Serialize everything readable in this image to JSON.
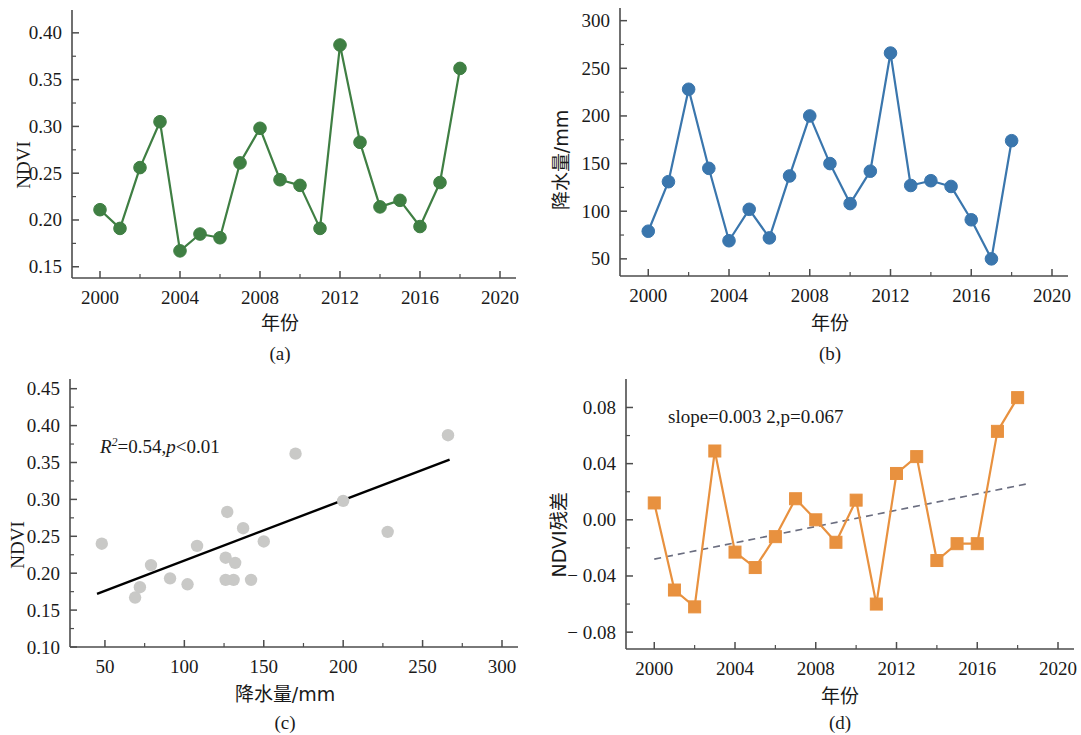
{
  "figure": {
    "panels": [
      "a",
      "b",
      "c",
      "d"
    ],
    "caption_a": "(a)",
    "caption_b": "(b)",
    "caption_c": "(c)",
    "caption_d": "(d)"
  },
  "labels": {
    "ndvi": "NDVI",
    "year": "年份",
    "precip_mm": "降水量/mm",
    "ndvi_residual": "NDVI残差"
  },
  "colors": {
    "green": "#3f7f43",
    "blue": "#3a76ad",
    "orange": "#e8913f",
    "scatter_gray": "#c9c9c7",
    "regression_black": "#000000",
    "trend_dashed": "#6b6e80",
    "axis": "#4d4d4d"
  },
  "chart_data": [
    {
      "id": "a",
      "type": "line",
      "title": "",
      "xlabel": "年份",
      "ylabel": "NDVI",
      "xlim": [
        1998.6,
        2020
      ],
      "ylim": [
        0.138,
        0.418
      ],
      "xticks": [
        2000,
        2004,
        2008,
        2012,
        2016,
        2020
      ],
      "xticklabels": [
        "2000",
        "2004",
        "2008",
        "2012",
        "2016",
        "2020"
      ],
      "yticks": [
        0.15,
        0.2,
        0.25,
        0.3,
        0.35,
        0.4
      ],
      "yticklabels": [
        "0.15",
        "0.20",
        "0.25",
        "0.30",
        "0.35",
        "0.40"
      ],
      "grid": false,
      "legend": "none",
      "marker": "circle",
      "color": "#3f7f43",
      "x": [
        2000,
        2001,
        2002,
        2003,
        2004,
        2005,
        2006,
        2007,
        2008,
        2009,
        2010,
        2011,
        2012,
        2013,
        2014,
        2015,
        2016,
        2017,
        2018
      ],
      "values": [
        0.211,
        0.191,
        0.256,
        0.305,
        0.167,
        0.185,
        0.181,
        0.261,
        0.298,
        0.243,
        0.237,
        0.191,
        0.387,
        0.283,
        0.214,
        0.221,
        0.193,
        0.24,
        0.362
      ]
    },
    {
      "id": "b",
      "type": "line",
      "title": "",
      "xlabel": "年份",
      "ylabel": "降水量/mm",
      "xlim": [
        1998.6,
        2020
      ],
      "ylim": [
        32,
        307
      ],
      "xticks": [
        2000,
        2004,
        2008,
        2012,
        2016,
        2020
      ],
      "xticklabels": [
        "2000",
        "2004",
        "2008",
        "2012",
        "2016",
        "2020"
      ],
      "yticks": [
        50,
        100,
        150,
        200,
        250,
        300
      ],
      "yticklabels": [
        "50",
        "100",
        "150",
        "200",
        "250",
        "300"
      ],
      "grid": false,
      "legend": "none",
      "marker": "circle",
      "color": "#3a76ad",
      "x": [
        2000,
        2001,
        2002,
        2003,
        2004,
        2005,
        2006,
        2007,
        2008,
        2009,
        2010,
        2011,
        2012,
        2013,
        2014,
        2015,
        2016,
        2017,
        2018
      ],
      "values": [
        79,
        131,
        228,
        145,
        69,
        102,
        72,
        137,
        200,
        150,
        108,
        142,
        266,
        127,
        132,
        126,
        91,
        50,
        174
      ]
    },
    {
      "id": "c",
      "type": "scatter",
      "title": "",
      "xlabel": "降水量/mm",
      "ylabel": "NDVI",
      "xlim": [
        28,
        300
      ],
      "ylim": [
        0.1,
        0.455
      ],
      "xticks": [
        50,
        100,
        150,
        200,
        250,
        300
      ],
      "xticklabels": [
        "50",
        "100",
        "150",
        "200",
        "250",
        "300"
      ],
      "yticks": [
        0.1,
        0.15,
        0.2,
        0.25,
        0.3,
        0.35,
        0.4,
        0.45
      ],
      "yticklabels": [
        "0.10",
        "0.15",
        "0.20",
        "0.25",
        "0.30",
        "0.35",
        "0.40",
        "0.45"
      ],
      "grid": false,
      "legend": "none",
      "marker": "circle",
      "color": "#c9c9c7",
      "annotation": "R²=0.54,p<0.01",
      "annotation_parts": {
        "r": "R",
        "sup": "2",
        "mid": "=0.54,",
        "p": "p",
        "tail": "<0.01"
      },
      "r_squared": 0.54,
      "p_value": "<0.01",
      "points": [
        {
          "x": 79,
          "y": 0.211
        },
        {
          "x": 131,
          "y": 0.191
        },
        {
          "x": 228,
          "y": 0.256
        },
        {
          "x": 266,
          "y": 0.387
        },
        {
          "x": 69,
          "y": 0.167
        },
        {
          "x": 102,
          "y": 0.185
        },
        {
          "x": 72,
          "y": 0.181
        },
        {
          "x": 137,
          "y": 0.261
        },
        {
          "x": 200,
          "y": 0.298
        },
        {
          "x": 150,
          "y": 0.243
        },
        {
          "x": 108,
          "y": 0.237
        },
        {
          "x": 142,
          "y": 0.191
        },
        {
          "x": 127,
          "y": 0.283
        },
        {
          "x": 132,
          "y": 0.214
        },
        {
          "x": 126,
          "y": 0.221
        },
        {
          "x": 91,
          "y": 0.193
        },
        {
          "x": 48,
          "y": 0.24
        },
        {
          "x": 170,
          "y": 0.362
        },
        {
          "x": 126,
          "y": 0.191
        }
      ],
      "regression_line": {
        "x1": 45,
        "y1": 0.172,
        "x2": 267,
        "y2": 0.354
      }
    },
    {
      "id": "d",
      "type": "line",
      "title": "",
      "xlabel": "年份",
      "ylabel": "NDVI残差",
      "xlim": [
        1998.6,
        2020
      ],
      "ylim": [
        -0.092,
        0.096
      ],
      "xticks": [
        2000,
        2004,
        2008,
        2012,
        2016,
        2020
      ],
      "xticklabels": [
        "2000",
        "2004",
        "2008",
        "2012",
        "2016",
        "2020"
      ],
      "yticks": [
        -0.08,
        -0.04,
        0.0,
        0.04,
        0.08
      ],
      "yticklabels": [
        "− 0.08",
        "− 0.04",
        "0.00",
        "0.04",
        "0.08"
      ],
      "grid": false,
      "legend": "none",
      "marker": "square",
      "color": "#e8913f",
      "annotation": "slope=0.003 2,p=0.067",
      "slope": 0.0032,
      "p_value": 0.067,
      "x": [
        2000,
        2001,
        2002,
        2003,
        2004,
        2005,
        2006,
        2007,
        2008,
        2009,
        2010,
        2011,
        2012,
        2013,
        2014,
        2015,
        2016,
        2017,
        2018
      ],
      "values": [
        0.012,
        -0.05,
        -0.062,
        0.049,
        -0.023,
        -0.034,
        -0.012,
        0.015,
        0.0,
        -0.016,
        0.014,
        -0.06,
        0.033,
        0.045,
        -0.029,
        -0.017,
        -0.017,
        0.063,
        0.087
      ],
      "trend_line": {
        "x1": 2000,
        "y1": -0.028,
        "x2": 2018.6,
        "y2": 0.026,
        "style": "dashed"
      }
    }
  ]
}
